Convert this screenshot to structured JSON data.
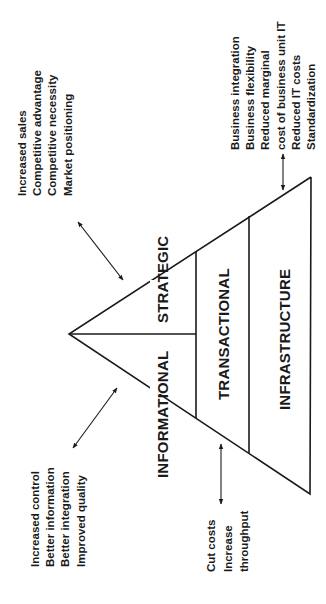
{
  "diagram": {
    "orientation": "rotated -90deg (pyramid apex points left)",
    "tiers": {
      "strategic": "STRATEGIC",
      "informational": "INFORMATIONAL",
      "transactional": "TRANSACTIONAL",
      "infrastructure": "INFRASTRUCTURE"
    },
    "benefits": {
      "strategic": [
        "Increased sales",
        "Competitive advantage",
        "Competitive necessity",
        "Market positioning"
      ],
      "informational": [
        "Increased control",
        "Better information",
        "Better integration",
        "Improved quality"
      ],
      "transactional": [
        "Cut costs",
        "Increase",
        "throughput"
      ],
      "infrastructure": [
        "Business integration",
        "Business flexibility",
        "Reduced marginal",
        "cost of business unit IT",
        "Reduced IT costs",
        "Standardization"
      ]
    },
    "colors": {
      "line": "#1a1a1a",
      "background": "#ffffff"
    }
  }
}
